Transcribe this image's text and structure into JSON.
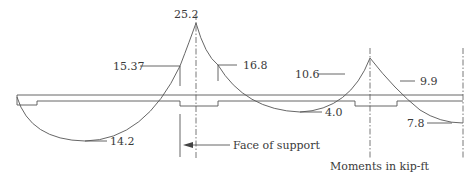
{
  "diagram": {
    "caption": "Moments in kip-ft",
    "face_of_support_label": "Face of support",
    "moments": {
      "span1_positive": "14.2",
      "support1_centerline": "25.2",
      "support1_left_face": "15.37",
      "support1_right_face": "16.8",
      "span2_positive": "4.0",
      "support2_left_face": "10.6",
      "support2_right_face": "9.9",
      "span3_end": "7.8"
    },
    "colors": {
      "line": "#555555",
      "text": "#3a3a3a",
      "background": "#ffffff"
    }
  }
}
